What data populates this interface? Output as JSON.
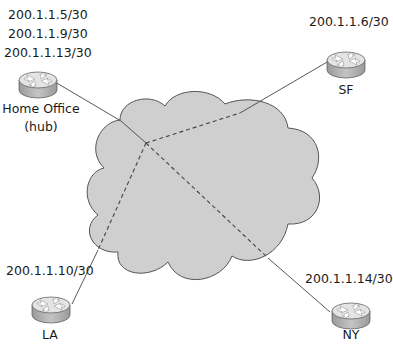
{
  "nodes": {
    "home": {
      "name": "Home Office",
      "sub": "(hub)",
      "addresses": [
        "200.1.1.5/30",
        "200.1.1.9/30",
        "200.1.1.13/30"
      ]
    },
    "sf": {
      "name": "SF",
      "address": "200.1.1.6/30"
    },
    "la": {
      "name": "LA",
      "address": "200.1.1.10/30"
    },
    "ny": {
      "name": "NY",
      "address": "200.1.1.14/30"
    }
  },
  "colors": {
    "cloud_fill": "#cfcfcf",
    "cloud_stroke": "#555555",
    "line": "#444444",
    "router_top": "#e6e6e6",
    "router_side": "#b8b8b8"
  }
}
